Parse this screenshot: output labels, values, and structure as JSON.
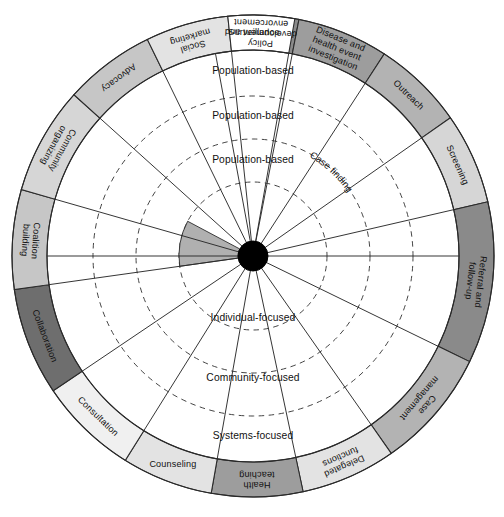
{
  "diagram": {
    "name": "Public Health Intervention Wheel",
    "geometry": {
      "cx": 253,
      "cy": 256,
      "r_outer": 241,
      "r_outer_inner": 206,
      "r_ring1": 160,
      "r_ring2": 117,
      "r_ring3": 74,
      "r_hub": 15
    },
    "colors": {
      "white": "#ffffff",
      "light1": "#f0f0f0",
      "light2": "#e3e3e3",
      "light3": "#d6d6d6",
      "mid1": "#c6c6c6",
      "mid2": "#b3b3b3",
      "mid3": "#9d9d9d",
      "dark1": "#8a8a8a",
      "dark2": "#6e6e6e",
      "stroke": "#2a2a2a",
      "hub": "#000000",
      "wedge": "#b0b0b0"
    },
    "outer_ring": {
      "name": "intervention-segments",
      "segments": [
        {
          "label": "Surveillance",
          "fill": "#8a8a8a",
          "start_deg": -100.5,
          "end_deg": -79.0,
          "orient": "upright",
          "lines": [
            "Surveillance"
          ]
        },
        {
          "label": "Disease and health event investigation",
          "fill": "#9d9d9d",
          "start_deg": -79.0,
          "end_deg": -57.0,
          "orient": "radial-right",
          "lines": [
            "Disease and",
            "health event",
            "investigation"
          ]
        },
        {
          "label": "Outreach",
          "fill": "#b3b3b3",
          "start_deg": -57.0,
          "end_deg": -35.0,
          "orient": "radial-right",
          "lines": [
            "Outreach"
          ]
        },
        {
          "label": "Screening",
          "fill": "#d6d6d6",
          "start_deg": -35.0,
          "end_deg": -13.0,
          "orient": "radial-right",
          "lines": [
            "Screening"
          ]
        },
        {
          "label": "Referral and follow-up",
          "fill": "#8a8a8a",
          "start_deg": -13.0,
          "end_deg": 26.0,
          "orient": "radial-right",
          "lines": [
            "Referral and",
            "follow-up"
          ]
        },
        {
          "label": "Case management",
          "fill": "#b3b3b3",
          "start_deg": 26.0,
          "end_deg": 55.0,
          "orient": "radial-right",
          "lines": [
            "Case",
            "management"
          ]
        },
        {
          "label": "Delegated functions",
          "fill": "#e3e3e3",
          "start_deg": 55.0,
          "end_deg": 78.0,
          "orient": "radial-right",
          "lines": [
            "Delegated",
            "functions"
          ]
        },
        {
          "label": "Health teaching",
          "fill": "#9d9d9d",
          "start_deg": 78.0,
          "end_deg": 100.0,
          "orient": "radial-right",
          "lines": [
            "Health",
            "teaching"
          ]
        },
        {
          "label": "Counseling",
          "fill": "#e3e3e3",
          "start_deg": 100.0,
          "end_deg": 122.0,
          "orient": "upright",
          "lines": [
            "Counseling"
          ]
        },
        {
          "label": "Consultation",
          "fill": "#f0f0f0",
          "start_deg": 122.0,
          "end_deg": 146.0,
          "orient": "radial-left",
          "lines": [
            "Consultation"
          ]
        },
        {
          "label": "Collaboration",
          "fill": "#6e6e6e",
          "start_deg": 146.0,
          "end_deg": 172.0,
          "orient": "radial-left",
          "lines": [
            "Collaboration"
          ]
        },
        {
          "label": "Coalition building",
          "fill": "#c6c6c6",
          "start_deg": 172.0,
          "end_deg": 196.0,
          "orient": "radial-left",
          "lines": [
            "Coalition",
            "building"
          ]
        },
        {
          "label": "Community organizing",
          "fill": "#d6d6d6",
          "start_deg": 196.0,
          "end_deg": 222.0,
          "orient": "radial-left",
          "lines": [
            "Community",
            "organizing"
          ]
        },
        {
          "label": "Advocacy",
          "fill": "#c6c6c6",
          "start_deg": 222.0,
          "end_deg": 244.0,
          "orient": "radial-left",
          "lines": [
            "Advocacy"
          ]
        },
        {
          "label": "Social marketing",
          "fill": "#e3e3e3",
          "start_deg": 244.0,
          "end_deg": 264.0,
          "orient": "radial-left",
          "lines": [
            "Social",
            "marketing"
          ]
        },
        {
          "label": "Policy development and enforcement",
          "fill": "#ffffff",
          "start_deg": 264.0,
          "end_deg": 280.0,
          "orient": "radial-left",
          "lines": [
            "Policy",
            "development and",
            "envorcement"
          ]
        }
      ]
    },
    "inner_rings": {
      "name": "practice-level-rings",
      "ring_labels_top": [
        {
          "text": "Population-based",
          "radius": 185,
          "angle_deg": -90
        },
        {
          "text": "Population-based",
          "radius": 140,
          "angle_deg": -90
        },
        {
          "text": "Population-based",
          "radius": 96,
          "angle_deg": -90
        }
      ],
      "ring_labels_bottom": [
        {
          "text": "Individual-focused",
          "radius": 62,
          "angle_deg": 90
        },
        {
          "text": "Community-focused",
          "radius": 122,
          "angle_deg": 90
        },
        {
          "text": "Systems-focused",
          "radius": 180,
          "angle_deg": 90
        }
      ],
      "curved_labels": [
        {
          "text": "Case finding",
          "radius": 117,
          "center_deg": -47
        }
      ]
    },
    "spokes": {
      "name": "radial-dividers",
      "angles_deg": [
        -100.5,
        -79.0,
        -57.0,
        -35.0,
        -13.0,
        26.0,
        55.0,
        78.0,
        100.0,
        122.0,
        146.0,
        172.0,
        196.0,
        222.0,
        244.0,
        264.0,
        280.0
      ]
    },
    "shaded_wedge": {
      "name": "highlighted-inner-wedge",
      "start_deg": 172.0,
      "end_deg": 208.0,
      "r_inner": 15,
      "r_outer": 74,
      "fill": "#b0b0b0"
    }
  }
}
